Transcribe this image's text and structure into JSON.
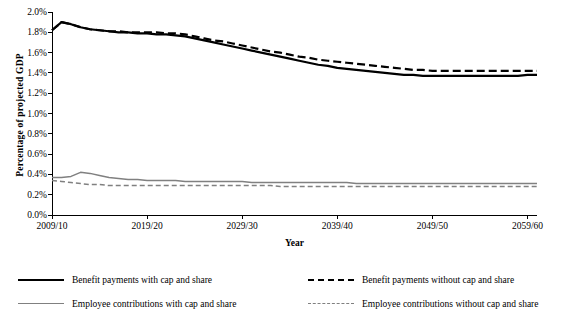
{
  "chart_data": {
    "type": "line",
    "title": "",
    "xlabel": "Year",
    "ylabel": "Percentage of projected GDP",
    "x": [
      "2009/10",
      "2019/20",
      "2029/30",
      "2039/40",
      "2049/50",
      "2059/60"
    ],
    "xlim": [
      2009,
      2060
    ],
    "ylim": [
      0.0,
      0.02
    ],
    "ytick_labels": [
      "0.0%",
      "0.2%",
      "0.4%",
      "0.6%",
      "0.8%",
      "1.0%",
      "1.2%",
      "1.4%",
      "1.6%",
      "1.8%",
      "2.0%"
    ],
    "ytick_values": [
      0.0,
      0.002,
      0.004,
      0.006,
      0.008,
      0.01,
      0.012,
      0.014,
      0.016,
      0.018,
      0.02
    ],
    "grid": false,
    "legend_position": "bottom",
    "series": [
      {
        "name": "Benefit payments with cap and share",
        "style": "solid",
        "color": "#000000",
        "width": 2.2,
        "points": [
          [
            2009,
            1.82
          ],
          [
            2010,
            1.9
          ],
          [
            2011,
            1.88
          ],
          [
            2012,
            1.85
          ],
          [
            2013,
            1.83
          ],
          [
            2014,
            1.82
          ],
          [
            2015,
            1.81
          ],
          [
            2016,
            1.8
          ],
          [
            2017,
            1.8
          ],
          [
            2018,
            1.79
          ],
          [
            2019,
            1.79
          ],
          [
            2020,
            1.78
          ],
          [
            2021,
            1.78
          ],
          [
            2022,
            1.77
          ],
          [
            2023,
            1.76
          ],
          [
            2024,
            1.74
          ],
          [
            2025,
            1.72
          ],
          [
            2026,
            1.7
          ],
          [
            2027,
            1.68
          ],
          [
            2028,
            1.66
          ],
          [
            2029,
            1.64
          ],
          [
            2030,
            1.62
          ],
          [
            2031,
            1.6
          ],
          [
            2032,
            1.58
          ],
          [
            2033,
            1.56
          ],
          [
            2034,
            1.54
          ],
          [
            2035,
            1.52
          ],
          [
            2036,
            1.5
          ],
          [
            2037,
            1.48
          ],
          [
            2038,
            1.47
          ],
          [
            2039,
            1.45
          ],
          [
            2040,
            1.44
          ],
          [
            2041,
            1.43
          ],
          [
            2042,
            1.42
          ],
          [
            2043,
            1.41
          ],
          [
            2044,
            1.4
          ],
          [
            2045,
            1.39
          ],
          [
            2046,
            1.38
          ],
          [
            2047,
            1.38
          ],
          [
            2048,
            1.37
          ],
          [
            2049,
            1.37
          ],
          [
            2050,
            1.37
          ],
          [
            2051,
            1.37
          ],
          [
            2052,
            1.37
          ],
          [
            2053,
            1.37
          ],
          [
            2054,
            1.37
          ],
          [
            2055,
            1.37
          ],
          [
            2056,
            1.37
          ],
          [
            2057,
            1.37
          ],
          [
            2058,
            1.37
          ],
          [
            2059,
            1.38
          ],
          [
            2060,
            1.38
          ]
        ]
      },
      {
        "name": "Benefit payments without cap and share",
        "style": "dashed",
        "color": "#000000",
        "width": 2.2,
        "points": [
          [
            2009,
            1.82
          ],
          [
            2010,
            1.9
          ],
          [
            2011,
            1.88
          ],
          [
            2012,
            1.85
          ],
          [
            2013,
            1.83
          ],
          [
            2014,
            1.82
          ],
          [
            2015,
            1.81
          ],
          [
            2016,
            1.81
          ],
          [
            2017,
            1.8
          ],
          [
            2018,
            1.8
          ],
          [
            2019,
            1.8
          ],
          [
            2020,
            1.8
          ],
          [
            2021,
            1.79
          ],
          [
            2022,
            1.79
          ],
          [
            2023,
            1.78
          ],
          [
            2024,
            1.76
          ],
          [
            2025,
            1.74
          ],
          [
            2026,
            1.72
          ],
          [
            2027,
            1.71
          ],
          [
            2028,
            1.69
          ],
          [
            2029,
            1.67
          ],
          [
            2030,
            1.65
          ],
          [
            2031,
            1.63
          ],
          [
            2032,
            1.61
          ],
          [
            2033,
            1.6
          ],
          [
            2034,
            1.58
          ],
          [
            2035,
            1.56
          ],
          [
            2036,
            1.55
          ],
          [
            2037,
            1.53
          ],
          [
            2038,
            1.52
          ],
          [
            2039,
            1.51
          ],
          [
            2040,
            1.5
          ],
          [
            2041,
            1.49
          ],
          [
            2042,
            1.48
          ],
          [
            2043,
            1.47
          ],
          [
            2044,
            1.46
          ],
          [
            2045,
            1.45
          ],
          [
            2046,
            1.44
          ],
          [
            2047,
            1.43
          ],
          [
            2048,
            1.43
          ],
          [
            2049,
            1.42
          ],
          [
            2050,
            1.42
          ],
          [
            2051,
            1.42
          ],
          [
            2052,
            1.42
          ],
          [
            2053,
            1.42
          ],
          [
            2054,
            1.42
          ],
          [
            2055,
            1.42
          ],
          [
            2056,
            1.42
          ],
          [
            2057,
            1.42
          ],
          [
            2058,
            1.42
          ],
          [
            2059,
            1.42
          ],
          [
            2060,
            1.42
          ]
        ]
      },
      {
        "name": "Employee contributions with cap and share",
        "style": "solid",
        "color": "#808080",
        "width": 1.5,
        "points": [
          [
            2009,
            0.37
          ],
          [
            2010,
            0.37
          ],
          [
            2011,
            0.38
          ],
          [
            2012,
            0.42
          ],
          [
            2013,
            0.41
          ],
          [
            2014,
            0.39
          ],
          [
            2015,
            0.37
          ],
          [
            2016,
            0.36
          ],
          [
            2017,
            0.35
          ],
          [
            2018,
            0.35
          ],
          [
            2019,
            0.34
          ],
          [
            2020,
            0.34
          ],
          [
            2021,
            0.34
          ],
          [
            2022,
            0.34
          ],
          [
            2023,
            0.33
          ],
          [
            2024,
            0.33
          ],
          [
            2025,
            0.33
          ],
          [
            2026,
            0.33
          ],
          [
            2027,
            0.33
          ],
          [
            2028,
            0.33
          ],
          [
            2029,
            0.33
          ],
          [
            2030,
            0.32
          ],
          [
            2031,
            0.32
          ],
          [
            2032,
            0.32
          ],
          [
            2033,
            0.32
          ],
          [
            2034,
            0.32
          ],
          [
            2035,
            0.32
          ],
          [
            2036,
            0.32
          ],
          [
            2037,
            0.32
          ],
          [
            2038,
            0.32
          ],
          [
            2039,
            0.32
          ],
          [
            2040,
            0.32
          ],
          [
            2041,
            0.31
          ],
          [
            2042,
            0.31
          ],
          [
            2043,
            0.31
          ],
          [
            2044,
            0.31
          ],
          [
            2045,
            0.31
          ],
          [
            2046,
            0.31
          ],
          [
            2047,
            0.31
          ],
          [
            2048,
            0.31
          ],
          [
            2049,
            0.31
          ],
          [
            2050,
            0.31
          ],
          [
            2051,
            0.31
          ],
          [
            2052,
            0.31
          ],
          [
            2053,
            0.31
          ],
          [
            2054,
            0.31
          ],
          [
            2055,
            0.31
          ],
          [
            2056,
            0.31
          ],
          [
            2057,
            0.31
          ],
          [
            2058,
            0.31
          ],
          [
            2059,
            0.31
          ],
          [
            2060,
            0.31
          ]
        ]
      },
      {
        "name": "Employee contributions without cap and share",
        "style": "dashed",
        "color": "#808080",
        "width": 1.5,
        "points": [
          [
            2009,
            0.34
          ],
          [
            2010,
            0.33
          ],
          [
            2011,
            0.32
          ],
          [
            2012,
            0.31
          ],
          [
            2013,
            0.3
          ],
          [
            2014,
            0.3
          ],
          [
            2015,
            0.29
          ],
          [
            2016,
            0.29
          ],
          [
            2017,
            0.29
          ],
          [
            2018,
            0.29
          ],
          [
            2019,
            0.29
          ],
          [
            2020,
            0.29
          ],
          [
            2021,
            0.29
          ],
          [
            2022,
            0.29
          ],
          [
            2023,
            0.29
          ],
          [
            2024,
            0.29
          ],
          [
            2025,
            0.29
          ],
          [
            2026,
            0.29
          ],
          [
            2027,
            0.29
          ],
          [
            2028,
            0.29
          ],
          [
            2029,
            0.29
          ],
          [
            2030,
            0.29
          ],
          [
            2031,
            0.29
          ],
          [
            2032,
            0.29
          ],
          [
            2033,
            0.28
          ],
          [
            2034,
            0.28
          ],
          [
            2035,
            0.28
          ],
          [
            2036,
            0.28
          ],
          [
            2037,
            0.28
          ],
          [
            2038,
            0.28
          ],
          [
            2039,
            0.28
          ],
          [
            2040,
            0.28
          ],
          [
            2041,
            0.28
          ],
          [
            2042,
            0.28
          ],
          [
            2043,
            0.28
          ],
          [
            2044,
            0.28
          ],
          [
            2045,
            0.28
          ],
          [
            2046,
            0.28
          ],
          [
            2047,
            0.28
          ],
          [
            2048,
            0.28
          ],
          [
            2049,
            0.28
          ],
          [
            2050,
            0.28
          ],
          [
            2051,
            0.28
          ],
          [
            2052,
            0.28
          ],
          [
            2053,
            0.28
          ],
          [
            2054,
            0.28
          ],
          [
            2055,
            0.28
          ],
          [
            2056,
            0.28
          ],
          [
            2057,
            0.28
          ],
          [
            2058,
            0.28
          ],
          [
            2059,
            0.28
          ],
          [
            2060,
            0.28
          ]
        ]
      }
    ]
  },
  "legend": [
    {
      "label": "Benefit payments with cap and share",
      "key": "solid-thick-black"
    },
    {
      "label": "Benefit payments without cap and share",
      "key": "dashed-thick-black"
    },
    {
      "label": "Employee contributions with cap and share",
      "key": "solid-thin-gray"
    },
    {
      "label": "Employee contributions without cap and share",
      "key": "dashed-thin-gray"
    }
  ]
}
